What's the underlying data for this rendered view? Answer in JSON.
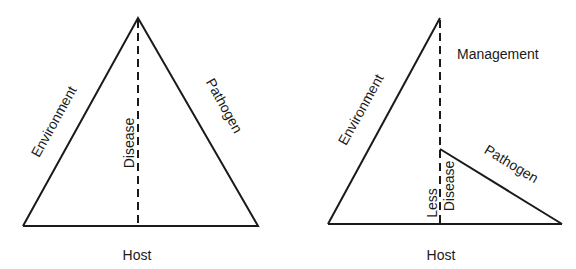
{
  "diagrams": [
    {
      "name": "disease-triangle",
      "labels": {
        "left_side": "Environment",
        "right_side": "Pathogen",
        "center": "Disease",
        "base": "Host"
      }
    },
    {
      "name": "disease-pyramid-with-management",
      "labels": {
        "left_side": "Environment",
        "right_side": "Pathogen",
        "top": "Management",
        "center_line1": "Less",
        "center_line2": "Disease",
        "base": "Host"
      }
    }
  ],
  "colors": {
    "line": "#1a1a1a",
    "background": "#ffffff"
  }
}
